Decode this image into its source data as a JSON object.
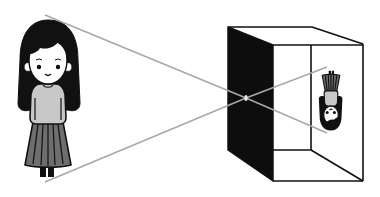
{
  "diagram": {
    "title": "Pinhole camera (camera obscura) principle",
    "device": "box with pinhole",
    "projection": "inverted image on back wall",
    "colors": {
      "background": "#ffffff",
      "outline": "#1a1a1a",
      "hair": "#111111",
      "skin": "#ffffff",
      "sweater": "#c8c8c8",
      "skirt": "#6e6e6e",
      "ray": "#a8a8a8",
      "box_front": "#0d0d0d"
    },
    "rays": [
      {
        "from": [
          45,
          15
        ],
        "through": [
          246,
          98
        ],
        "to": [
          327,
          67
        ]
      },
      {
        "from": [
          45,
          182
        ],
        "through": [
          246,
          98
        ],
        "to": [
          327,
          133
        ]
      }
    ],
    "pinhole": [
      246,
      98
    ]
  }
}
